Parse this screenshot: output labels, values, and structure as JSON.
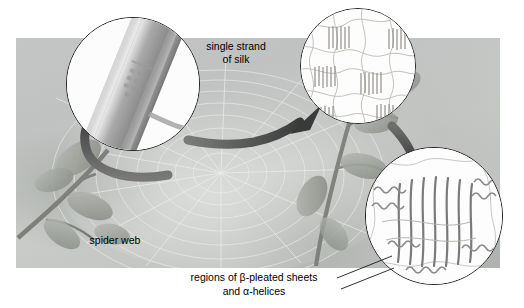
{
  "figure": {
    "background_label": "spider web",
    "strand_label_line1": "single strand",
    "strand_label_line2": "of silk",
    "sheet_caption_line1": "regions of β-pleated sheets",
    "sheet_caption_line2": "and α-helices"
  },
  "colors": {
    "photo_base": "#c3c6c4",
    "arrow_dark": "#4a4a4a",
    "arrow_mid": "#6f6f6f",
    "outline": "#232323",
    "silk_fiber": "#8a8a8a",
    "inset_bg": "#fdfdfd",
    "text": "#000000"
  },
  "insets": [
    {
      "name": "silk-strand-inset",
      "content": "single silk fiber surface with scale markings",
      "cx": 132,
      "cy": 83,
      "r": 66
    },
    {
      "name": "protein-network-inset",
      "content": "tangled polymer network with beta-pleated sheet comb regions",
      "cx": 357,
      "cy": 65,
      "r": 57
    },
    {
      "name": "beta-sheet-detail-inset",
      "content": "beta-pleated sheet parallel strands with alpha-helix coils",
      "cx": 433,
      "cy": 215,
      "r": 68
    }
  ],
  "arrows": [
    {
      "name": "arrow-web-to-strand",
      "from": "spider web",
      "to": "silk strand inset"
    },
    {
      "name": "arrow-strand-to-network",
      "from": "silk strand",
      "to": "protein network inset"
    },
    {
      "name": "arrow-network-to-sheet",
      "from": "protein network",
      "to": "beta sheet inset"
    }
  ]
}
